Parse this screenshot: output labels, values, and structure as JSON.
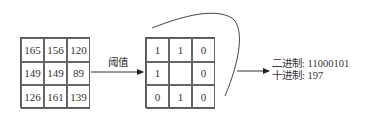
{
  "input_grid": {
    "rows": [
      [
        "165",
        "156",
        "120"
      ],
      [
        "149",
        "149",
        "89"
      ],
      [
        "126",
        "161",
        "139"
      ]
    ]
  },
  "threshold_label": "阈值",
  "binary_grid": {
    "rows": [
      [
        "1",
        "1",
        "0"
      ],
      [
        "1",
        "",
        "0"
      ],
      [
        "0",
        "1",
        "0"
      ]
    ]
  },
  "result": {
    "binary_line": "二进制: 11000101",
    "decimal_line": "十进制: 197"
  }
}
